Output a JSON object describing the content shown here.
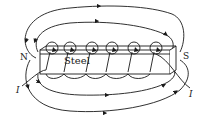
{
  "diagram": {
    "labels": {
      "core": "Steel",
      "north_pole": "N",
      "south_pole": "S",
      "current_left": "I",
      "current_right": "I"
    },
    "coil_turns": 6,
    "field_lines": {
      "top_count": 2,
      "bottom_count": 2,
      "direction": "exit N, loop around, enter S"
    },
    "colors": {
      "line": "#1a1a1a",
      "background": "#ffffff"
    }
  }
}
